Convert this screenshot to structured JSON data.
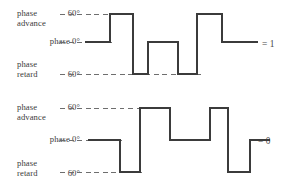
{
  "figure": {
    "line_color": "#3b3b3b",
    "dash_color": "#6e6e6e",
    "background": "#ffffff"
  },
  "panels": [
    {
      "id": "panel-top",
      "result_label": "= 1",
      "axis_labels": {
        "advance_name_line1": "phase",
        "advance_name_line2": "advance",
        "advance_value": "60°",
        "zero_value": "phase 0°",
        "retard_name_line1": "phase",
        "retard_name_line2": "retard",
        "retard_value": "60°"
      },
      "levels": {
        "advance": 60,
        "zero": 0,
        "retard": -60
      },
      "segments": [
        {
          "level": 0,
          "x0": 85,
          "x1": 110
        },
        {
          "level": 60,
          "x0": 110,
          "x1": 133
        },
        {
          "level": -60,
          "x0": 133,
          "x1": 148
        },
        {
          "level": 0,
          "x0": 148,
          "x1": 178
        },
        {
          "level": -60,
          "x0": 178,
          "x1": 197
        },
        {
          "level": 60,
          "x0": 197,
          "x1": 222
        },
        {
          "level": 0,
          "x0": 222,
          "x1": 258
        }
      ]
    },
    {
      "id": "panel-bottom",
      "result_label": "= 0",
      "axis_labels": {
        "advance_name_line1": "phase",
        "advance_name_line2": "advance",
        "advance_value": "60°",
        "zero_value": "phase 0°",
        "retard_name_line1": "phase",
        "retard_name_line2": "retard",
        "retard_value": "60°"
      },
      "levels": {
        "advance": 60,
        "zero": 0,
        "retard": -60
      },
      "segments": [
        {
          "level": 0,
          "x0": 88,
          "x1": 120
        },
        {
          "level": -60,
          "x0": 120,
          "x1": 140
        },
        {
          "level": 60,
          "x0": 140,
          "x1": 170
        },
        {
          "level": 0,
          "x0": 170,
          "x1": 210
        },
        {
          "level": 60,
          "x0": 210,
          "x1": 228
        },
        {
          "level": -60,
          "x0": 228,
          "x1": 250
        },
        {
          "level": 0,
          "x0": 250,
          "x1": 270
        }
      ]
    }
  ],
  "chart_data": {
    "type": "line",
    "title": "",
    "xlabel": "",
    "ylabel": "phase",
    "ylim": [
      -60,
      60
    ],
    "ytick_labels": [
      "60° (phase advance)",
      "phase 0°",
      "60° (phase retard)"
    ],
    "grid": false,
    "legend": "none",
    "series": [
      {
        "name": "= 1",
        "values": [
          0,
          60,
          -60,
          0,
          -60,
          60,
          0
        ],
        "x": [
          85,
          110,
          133,
          148,
          178,
          197,
          222
        ]
      },
      {
        "name": "= 0",
        "values": [
          0,
          -60,
          60,
          0,
          60,
          -60,
          0
        ],
        "x": [
          88,
          120,
          140,
          170,
          210,
          228,
          250
        ]
      }
    ]
  }
}
